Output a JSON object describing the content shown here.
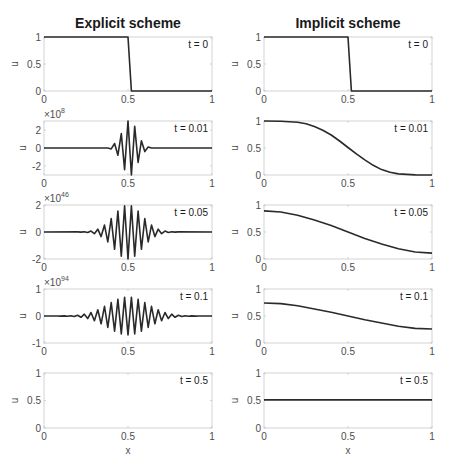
{
  "figure": {
    "columns": [
      {
        "title": "Explicit scheme"
      },
      {
        "title": "Implicit scheme"
      }
    ],
    "xlabel": "x",
    "ylabel": "u"
  },
  "chart_data": [
    {
      "type": "line",
      "panel": "explicit-t0",
      "title": "Explicit scheme",
      "annotation": "t = 0",
      "xlabel": "",
      "ylabel": "u",
      "xlim": [
        0,
        1
      ],
      "ylim": [
        0,
        1
      ],
      "xticks": [
        "0",
        "0.5",
        "1"
      ],
      "yticks": [
        {
          "v": 0,
          "l": "0"
        },
        {
          "v": 0.5,
          "l": "0.5"
        },
        {
          "v": 1,
          "l": "1"
        }
      ],
      "exponent": "",
      "series": [
        {
          "name": "u(x, t=0)",
          "x": [
            0,
            0.5,
            0.52,
            1
          ],
          "y": [
            1,
            1,
            0,
            0
          ]
        }
      ]
    },
    {
      "type": "line",
      "panel": "explicit-t0.01",
      "annotation": "t = 0.01",
      "xlabel": "",
      "ylabel": "u",
      "xlim": [
        0,
        1
      ],
      "ylim": [
        -3,
        3
      ],
      "xticks": [
        "0",
        "0.5",
        "1"
      ],
      "yticks": [
        {
          "v": -2,
          "l": "-2"
        },
        {
          "v": 0,
          "l": "0"
        },
        {
          "v": 2,
          "l": "2"
        }
      ],
      "exponent": "8",
      "series": [
        {
          "name": "u(x, t=0.01) ×10^8",
          "x": [
            0,
            0.38,
            0.4,
            0.42,
            0.44,
            0.46,
            0.48,
            0.5,
            0.52,
            0.54,
            0.56,
            0.58,
            0.6,
            0.62,
            0.64,
            1
          ],
          "y": [
            0,
            0,
            -0.1,
            0.5,
            -0.8,
            1.6,
            -2.4,
            3.0,
            -3.0,
            2.4,
            -1.6,
            0.8,
            -0.4,
            0.1,
            0,
            0
          ]
        }
      ]
    },
    {
      "type": "line",
      "panel": "explicit-t0.05",
      "annotation": "t = 0.05",
      "xlabel": "",
      "ylabel": "u",
      "xlim": [
        0,
        1
      ],
      "ylim": [
        -2,
        2
      ],
      "xticks": [
        "0",
        "0.5",
        "1"
      ],
      "yticks": [
        {
          "v": -2,
          "l": "-2"
        },
        {
          "v": 0,
          "l": "0"
        },
        {
          "v": 2,
          "l": "2"
        }
      ],
      "exponent": "46",
      "series": [
        {
          "name": "u(x, t=0.05) ×10^46",
          "envelope": {
            "center": 0.5,
            "width": 0.12,
            "amp": 2.0,
            "start": 0.2,
            "end": 0.8,
            "step": 0.02
          }
        }
      ]
    },
    {
      "type": "line",
      "panel": "explicit-t0.1",
      "annotation": "t = 0.1",
      "xlabel": "",
      "ylabel": "u",
      "xlim": [
        0,
        1
      ],
      "ylim": [
        -1,
        1
      ],
      "xticks": [
        "0",
        "0.5",
        "1"
      ],
      "yticks": [
        {
          "v": -1,
          "l": "-1"
        },
        {
          "v": 0,
          "l": "0"
        },
        {
          "v": 1,
          "l": "1"
        }
      ],
      "exponent": "94",
      "series": [
        {
          "name": "u(x, t=0.1) ×10^94",
          "envelope": {
            "center": 0.5,
            "width": 0.17,
            "amp": 0.7,
            "start": 0.04,
            "end": 0.96,
            "step": 0.02
          }
        }
      ]
    },
    {
      "type": "line",
      "panel": "explicit-t0.5",
      "annotation": "t = 0.5",
      "xlabel": "x",
      "ylabel": "u",
      "xlim": [
        0,
        1
      ],
      "ylim": [
        0,
        1
      ],
      "xticks": [
        "0",
        "0.5",
        "1"
      ],
      "yticks": [
        {
          "v": 0,
          "l": "0"
        },
        {
          "v": 0.5,
          "l": "0.5"
        },
        {
          "v": 1,
          "l": "1"
        }
      ],
      "exponent": "",
      "series": []
    },
    {
      "type": "line",
      "panel": "implicit-t0",
      "title": "Implicit scheme",
      "annotation": "t = 0",
      "xlabel": "",
      "ylabel": "u",
      "xlim": [
        0,
        1
      ],
      "ylim": [
        0,
        1
      ],
      "xticks": [
        "0",
        "0.5",
        "1"
      ],
      "yticks": [
        {
          "v": 0,
          "l": "0"
        },
        {
          "v": 0.5,
          "l": "0.5"
        },
        {
          "v": 1,
          "l": "1"
        }
      ],
      "exponent": "",
      "series": [
        {
          "name": "u(x, t=0)",
          "x": [
            0,
            0.5,
            0.52,
            1
          ],
          "y": [
            1,
            1,
            0,
            0
          ]
        }
      ]
    },
    {
      "type": "line",
      "panel": "implicit-t0.01",
      "annotation": "t = 0.01",
      "xlabel": "",
      "ylabel": "u",
      "xlim": [
        0,
        1
      ],
      "ylim": [
        0,
        1
      ],
      "xticks": [
        "0",
        "0.5",
        "1"
      ],
      "yticks": [
        {
          "v": 0,
          "l": "0"
        },
        {
          "v": 0.5,
          "l": "0.5"
        },
        {
          "v": 1,
          "l": "1"
        }
      ],
      "exponent": "",
      "series": [
        {
          "name": "u(x, t=0.01)",
          "x": [
            0,
            0.1,
            0.2,
            0.25,
            0.3,
            0.35,
            0.4,
            0.45,
            0.5,
            0.55,
            0.6,
            0.65,
            0.7,
            0.75,
            0.8,
            0.9,
            1
          ],
          "y": [
            1,
            0.995,
            0.975,
            0.95,
            0.9,
            0.83,
            0.74,
            0.63,
            0.51,
            0.39,
            0.28,
            0.18,
            0.1,
            0.05,
            0.02,
            0.002,
            0
          ]
        }
      ]
    },
    {
      "type": "line",
      "panel": "implicit-t0.05",
      "annotation": "t = 0.05",
      "xlabel": "",
      "ylabel": "u",
      "xlim": [
        0,
        1
      ],
      "ylim": [
        0,
        1
      ],
      "xticks": [
        "0",
        "0.5",
        "1"
      ],
      "yticks": [
        {
          "v": 0,
          "l": "0"
        },
        {
          "v": 0.5,
          "l": "0.5"
        },
        {
          "v": 1,
          "l": "1"
        }
      ],
      "exponent": "",
      "series": [
        {
          "name": "u(x, t=0.05)",
          "x": [
            0,
            0.1,
            0.2,
            0.3,
            0.4,
            0.5,
            0.6,
            0.7,
            0.8,
            0.9,
            1
          ],
          "y": [
            0.89,
            0.87,
            0.81,
            0.72,
            0.62,
            0.5,
            0.38,
            0.28,
            0.19,
            0.13,
            0.11
          ]
        }
      ]
    },
    {
      "type": "line",
      "panel": "implicit-t0.1",
      "annotation": "t = 0.1",
      "xlabel": "",
      "ylabel": "u",
      "xlim": [
        0,
        1
      ],
      "ylim": [
        0,
        1
      ],
      "xticks": [
        "0",
        "0.5",
        "1"
      ],
      "yticks": [
        {
          "v": 0,
          "l": "0"
        },
        {
          "v": 0.5,
          "l": "0.5"
        },
        {
          "v": 1,
          "l": "1"
        }
      ],
      "exponent": "",
      "series": [
        {
          "name": "u(x, t=0.1)",
          "x": [
            0,
            0.1,
            0.2,
            0.3,
            0.4,
            0.5,
            0.6,
            0.7,
            0.8,
            0.9,
            1
          ],
          "y": [
            0.74,
            0.73,
            0.69,
            0.63,
            0.57,
            0.5,
            0.43,
            0.37,
            0.31,
            0.27,
            0.26
          ]
        }
      ]
    },
    {
      "type": "line",
      "panel": "implicit-t0.5",
      "annotation": "t = 0.5",
      "xlabel": "x",
      "ylabel": "u",
      "xlim": [
        0,
        1
      ],
      "ylim": [
        0,
        1
      ],
      "xticks": [
        "0",
        "0.5",
        "1"
      ],
      "yticks": [
        {
          "v": 0,
          "l": "0"
        },
        {
          "v": 0.5,
          "l": "0.5"
        },
        {
          "v": 1,
          "l": "1"
        }
      ],
      "exponent": "",
      "series": [
        {
          "name": "u(x, t=0.5)",
          "x": [
            0,
            1
          ],
          "y": [
            0.51,
            0.51
          ]
        }
      ]
    }
  ],
  "layout": {
    "columns_x": [
      [
        44,
        212
      ],
      [
        264,
        432
      ]
    ],
    "rows_y": [
      [
        37,
        91
      ],
      [
        121,
        175
      ],
      [
        205,
        259
      ],
      [
        289,
        343
      ],
      [
        373,
        428
      ]
    ],
    "grid": false,
    "colors": {
      "line": "#2a2a2a",
      "axis": "#c8c8c8",
      "text": "#4d4d4d"
    }
  }
}
